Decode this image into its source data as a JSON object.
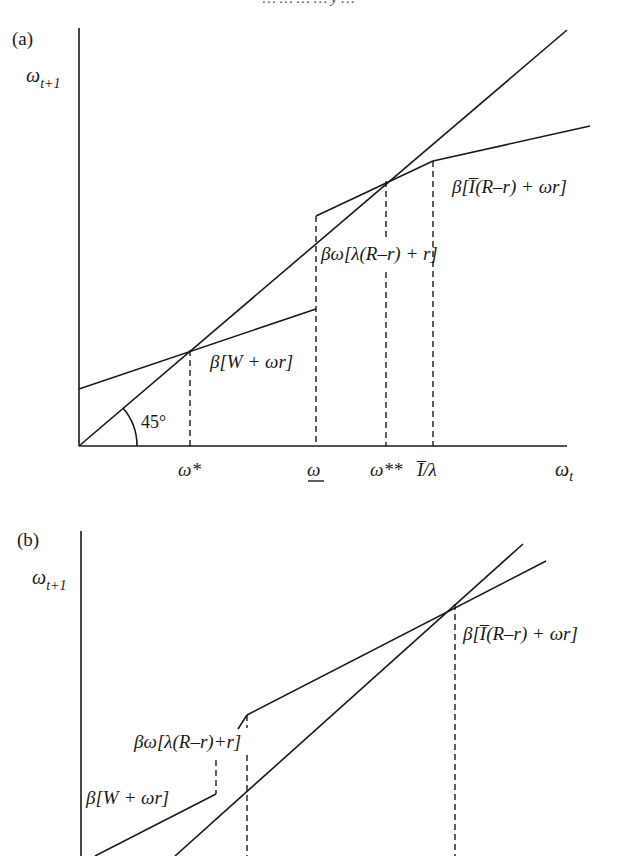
{
  "header": {
    "running_title": "… … … … y …"
  },
  "panel_a": {
    "panel_label": "(a)",
    "y_axis_label": "ω",
    "y_axis_sub": "t+1",
    "x_axis_label": "ω",
    "x_axis_sub": "t",
    "angle_label": "45°",
    "ticks": {
      "omega_star": "ω*",
      "omega_under": "ω",
      "omega_double_star": "ω**",
      "ibar_over_lambda": "I̅/λ"
    },
    "curve_labels": {
      "low_segment": "β[W + ωr]",
      "mid_segment": "βω[λ(R–r) + r]",
      "high_segment": "β[I̅(R–r) + ωr]"
    }
  },
  "panel_b": {
    "panel_label": "(b)",
    "y_axis_label": "ω",
    "y_axis_sub": "t+1",
    "curve_labels": {
      "low_segment": "β[W + ωr]",
      "mid_segment": "βω[λ(R–r)+r]",
      "high_segment": "β[I̅(R–r) + ωr]"
    }
  }
}
